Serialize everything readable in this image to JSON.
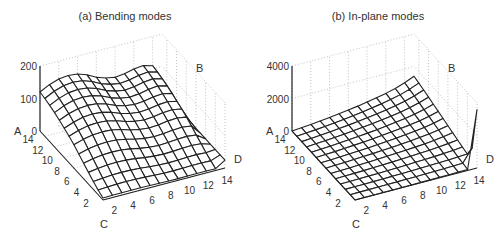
{
  "chart_data": [
    {
      "type": "surface",
      "title": "(a) Bending modes",
      "axes": {
        "z_label": "A",
        "y_label": "B",
        "x_label": "C",
        "x2_label": "D",
        "z_ticks": [
          "0",
          "100",
          "200"
        ],
        "z_range": [
          0,
          200
        ],
        "c_ticks": [
          "2",
          "4",
          "6",
          "8",
          "10",
          "12",
          "14"
        ],
        "d_ticks": [
          "2",
          "4",
          "6",
          "8",
          "10",
          "12",
          "14"
        ],
        "grid": true
      },
      "grid_size": [
        14,
        14
      ],
      "description": "Surface peaks ~150 near high C / mid D, dips toward low C; drops sharply near D=14 edge",
      "profile_along_D_at_highC": [
        120,
        135,
        145,
        148,
        145,
        135,
        120,
        110,
        105,
        108,
        115,
        118,
        110,
        40
      ],
      "profile_along_C_scale": [
        0.05,
        0.12,
        0.2,
        0.3,
        0.4,
        0.5,
        0.6,
        0.68,
        0.75,
        0.82,
        0.88,
        0.93,
        0.97,
        1.0
      ]
    },
    {
      "type": "surface",
      "title": "(b) In-plane modes",
      "axes": {
        "z_label": "A",
        "y_label": "B",
        "x_label": "C",
        "x2_label": "D",
        "z_ticks": [
          "0",
          "2000",
          "4000"
        ],
        "z_range": [
          0,
          4000
        ],
        "c_ticks": [
          "2",
          "4",
          "6",
          "8",
          "10",
          "12",
          "14"
        ],
        "d_ticks": [
          "2",
          "4",
          "6",
          "8",
          "10",
          "12",
          "14"
        ],
        "grid": true
      },
      "grid_size": [
        14,
        14
      ],
      "description": "Nearly flat low surface rising toward high C / high D corner (~1400), with a spike at D=14 edge near C=1",
      "profile_along_D_at_highC": [
        0,
        50,
        100,
        160,
        230,
        300,
        380,
        470,
        570,
        680,
        800,
        950,
        1150,
        1400
      ],
      "profile_along_C_scale": [
        0.05,
        0.1,
        0.15,
        0.22,
        0.3,
        0.38,
        0.46,
        0.54,
        0.62,
        0.7,
        0.78,
        0.86,
        0.93,
        1.0
      ]
    }
  ]
}
